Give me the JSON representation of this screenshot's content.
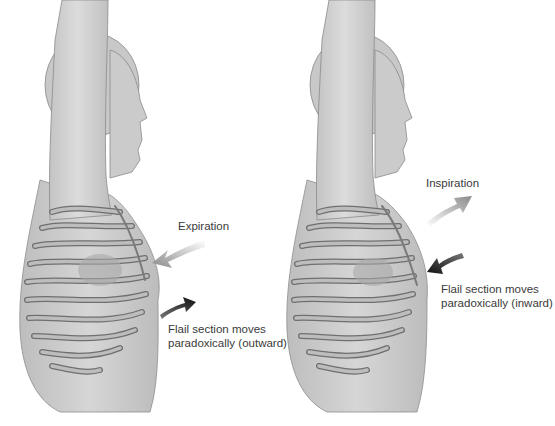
{
  "figure": {
    "left_panel": {
      "phase_label": "Expiration",
      "flail_label_line1": "Flail section moves",
      "flail_label_line2": "paradoxically (outward)",
      "phase_arrow": {
        "direction": "inward",
        "color": "#8a8a8a"
      },
      "flail_arrow": {
        "direction": "outward",
        "color": "#111111"
      }
    },
    "right_panel": {
      "phase_label": "Inspiration",
      "flail_label_line1": "Flail section moves",
      "flail_label_line2": "paradoxically (inward)",
      "phase_arrow": {
        "direction": "outward",
        "color": "#8a8a8a"
      },
      "flail_arrow": {
        "direction": "inward",
        "color": "#111111"
      }
    },
    "colors": {
      "body": "#c9c9c9",
      "body_shade": "#a9a9a9",
      "rib": "#b8b8b8",
      "rib_edge": "#6f6f6f"
    }
  }
}
